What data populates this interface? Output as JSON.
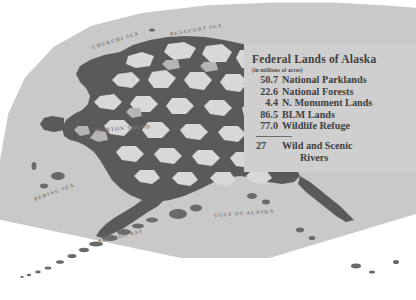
{
  "map": {
    "title_block": {
      "title": "Federal Lands of Alaska",
      "subtitle": "(in millions of acres)",
      "entries": [
        {
          "value": "50.7",
          "label": "National Parklands"
        },
        {
          "value": "22.6",
          "label": "National Forests"
        },
        {
          "value": "4.4",
          "label": "N. Monument Lands"
        },
        {
          "value": "86.5",
          "label": "BLM Lands"
        },
        {
          "value": "77.0",
          "label": "Wildlife Refuge"
        }
      ],
      "rivers": {
        "value": "27",
        "label_line1": "Wild and Scenic",
        "label_line2": "Rivers"
      }
    },
    "water_labels": [
      {
        "name": "chukchi-sea",
        "text": "CHUKCHI SEA"
      },
      {
        "name": "beaufort-sea",
        "text": "BEAUFORT SEA"
      },
      {
        "name": "norton-sound",
        "text": "NORTON SOUND"
      },
      {
        "name": "bering-sea",
        "text": "BERING SEA"
      },
      {
        "name": "bristol-bay",
        "text": "BRISTOL BAY"
      },
      {
        "name": "gulf-of-alaska",
        "text": "GULF OF ALASKA"
      }
    ],
    "colors": {
      "ocean": "#c9c9c9",
      "land": "#5a5a5a",
      "federal_land": "#d8d8d8",
      "page": "#ffffff",
      "legend_panel": "#cfcfcf",
      "text": "#3f3f3f",
      "geo_label": "#7b7b7b"
    }
  }
}
